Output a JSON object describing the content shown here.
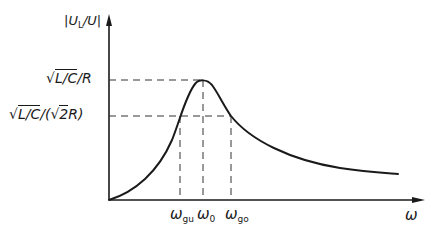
{
  "diagram": {
    "y_axis": {
      "label_main": "|U",
      "label_sub": "L",
      "label_rest": "/U|"
    },
    "x_axis": {
      "label": "ω"
    },
    "levels": {
      "peak": {
        "sqrt": "√",
        "radicand": "L/C",
        "suffix": "/R"
      },
      "half_power": {
        "sqrt": "√",
        "radicand": "L/C",
        "mid": "/(",
        "sqrt2": "√",
        "radicand2": "2",
        "suffix": "R)"
      }
    },
    "ticks": [
      {
        "main": "ω",
        "sub": "gu"
      },
      {
        "main": "ω",
        "sub": "0"
      },
      {
        "main": "ω",
        "sub": "go"
      }
    ],
    "colors": {
      "line": "#1a1a1a",
      "dashed": "#333333",
      "background": "#ffffff"
    }
  }
}
